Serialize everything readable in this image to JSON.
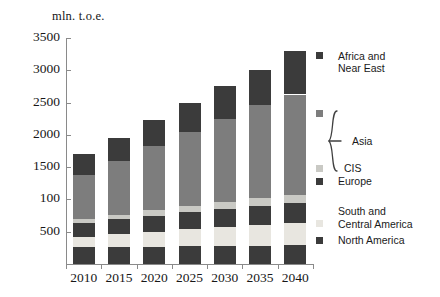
{
  "chart_data": {
    "type": "bar",
    "title": "mln. t.o.e.",
    "subtitle": "",
    "xlabel": "",
    "ylabel": "mln. t.o.e.",
    "stacked": true,
    "grid": false,
    "legend_position": "right",
    "ylim": [
      0,
      3500
    ],
    "ytick_values": [
      500,
      1000,
      1500,
      2000,
      2500,
      3000,
      3500
    ],
    "ytick_labels": [
      "500",
      "100",
      "1500",
      "2000",
      "2500",
      "3000",
      "3500"
    ],
    "categories": [
      "2010",
      "2015",
      "2020",
      "2025",
      "2030",
      "2035",
      "2040"
    ],
    "series": [
      {
        "name": "North America",
        "color": "#3b3b3b",
        "values": [
          260,
          265,
          270,
          275,
          280,
          285,
          290
        ]
      },
      {
        "name": "South and Central America",
        "color": "#e8e6e0",
        "values": [
          160,
          195,
          230,
          265,
          295,
          325,
          350
        ]
      },
      {
        "name": "Europe",
        "color": "#3b3b3b",
        "values": [
          220,
          235,
          250,
          270,
          280,
          295,
          305
        ]
      },
      {
        "name": "CIS",
        "color": "#c9c9c4",
        "values": [
          55,
          65,
          80,
          90,
          100,
          110,
          120
        ]
      },
      {
        "name": "Asia",
        "color": "#7d7d7d",
        "values": [
          680,
          835,
          990,
          1140,
          1290,
          1440,
          1560
        ]
      },
      {
        "name": "Africa and Near East",
        "color": "#3b3b3b",
        "values": [
          325,
          355,
          410,
          460,
          505,
          545,
          675
        ]
      }
    ],
    "totals": [
      1700,
      1950,
      2230,
      2500,
      2750,
      3000,
      3300
    ],
    "annotations": [
      {
        "text": "Asia",
        "type": "brace",
        "note": "curly brace spans the Asia and CIS swatch pair in the legend"
      }
    ]
  },
  "legend": {
    "entries": [
      {
        "label_line1": "Africa and",
        "label_line2": "Near East",
        "color": "#3b3b3b"
      },
      {
        "label_line1": "Asia",
        "label_line2": "",
        "color": "#7d7d7d"
      },
      {
        "label_line1": "CIS",
        "label_line2": "",
        "color": "#c9c9c4"
      },
      {
        "label_line1": "Europe",
        "label_line2": "",
        "color": "#3b3b3b"
      },
      {
        "label_line1": "South and",
        "label_line2": "Central America",
        "color": "#e8e6e0"
      },
      {
        "label_line1": "North America",
        "label_line2": "",
        "color": "#3b3b3b"
      }
    ]
  },
  "colors": {
    "axis": "#8a8a8a",
    "text": "#171717",
    "background": "#ffffff",
    "dark": "#3b3b3b",
    "mid_gray": "#7d7d7d",
    "light_gray": "#c9c9c4",
    "pale": "#e8e6e0"
  }
}
